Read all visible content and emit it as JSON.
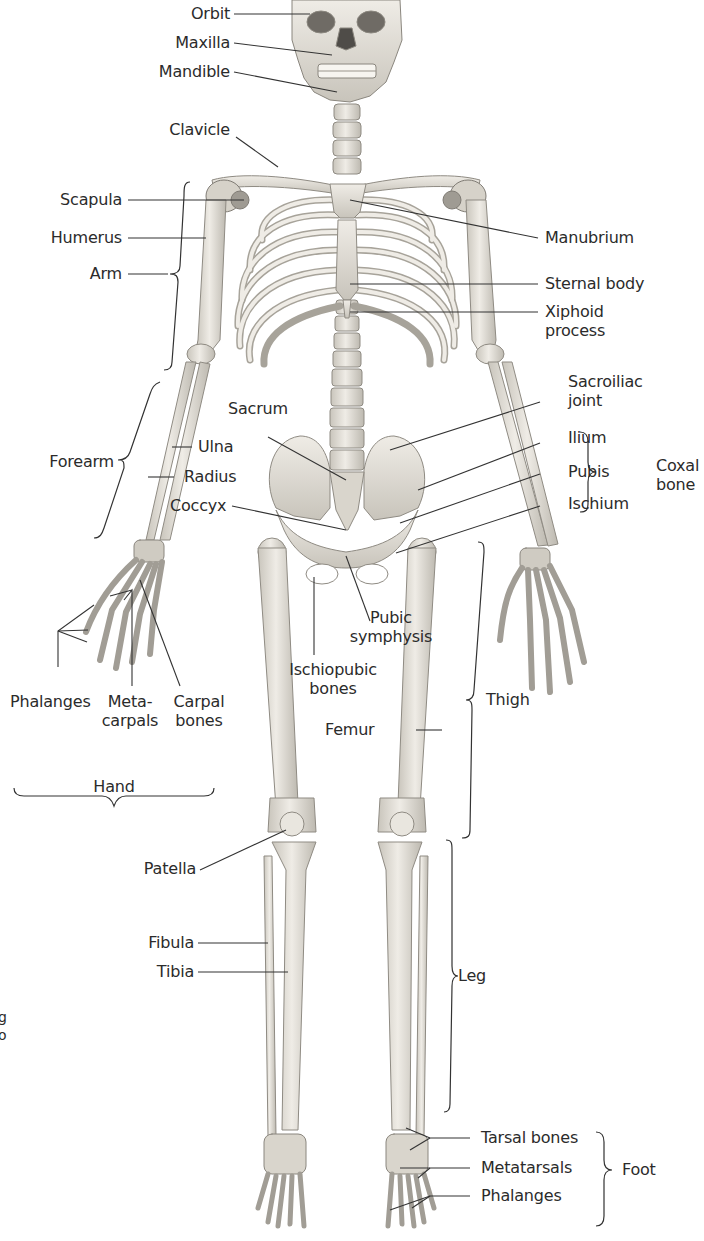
{
  "figure": {
    "colors": {
      "bone": "#e9e6df",
      "bone_shadow": "#b9b5ac",
      "bone_dark": "#6e6b66",
      "line": "#333333",
      "text": "#2b2b2b",
      "background": "#ffffff"
    }
  },
  "labels": {
    "orbit": "Orbit",
    "maxilla": "Maxilla",
    "mandible": "Mandible",
    "clavicle": "Clavicle",
    "scapula": "Scapula",
    "humerus": "Humerus",
    "arm": "Arm",
    "manubrium": "Manubrium",
    "sternal_body": "Sternal body",
    "xiphoid_1": "Xiphoid",
    "xiphoid_2": "process",
    "sacroiliac_1": "Sacroiliac",
    "sacroiliac_2": "joint",
    "ilium": "Ilium",
    "pubis": "Pubis",
    "ischium": "Ischium",
    "coxal_1": "Coxal",
    "coxal_2": "bone",
    "sacrum": "Sacrum",
    "forearm": "Forearm",
    "ulna": "Ulna",
    "radius": "Radius",
    "coccyx": "Coccyx",
    "pubic_symphysis_1": "Pubic",
    "pubic_symphysis_2": "symphysis",
    "ischiopubic_1": "Ischiopubic",
    "ischiopubic_2": "bones",
    "phalanges_hand": "Phalanges",
    "metacarpals_1": "Meta-",
    "metacarpals_2": "carpals",
    "carpal_1": "Carpal",
    "carpal_2": "bones",
    "hand": "Hand",
    "femur": "Femur",
    "thigh": "Thigh",
    "patella": "Patella",
    "fibula": "Fibula",
    "tibia": "Tibia",
    "leg": "Leg",
    "tarsal_bones": "Tarsal bones",
    "metatarsals": "Metatarsals",
    "phalanges_foot": "Phalanges",
    "foot": "Foot",
    "cut_text_1": "g",
    "cut_text_2": "o"
  }
}
